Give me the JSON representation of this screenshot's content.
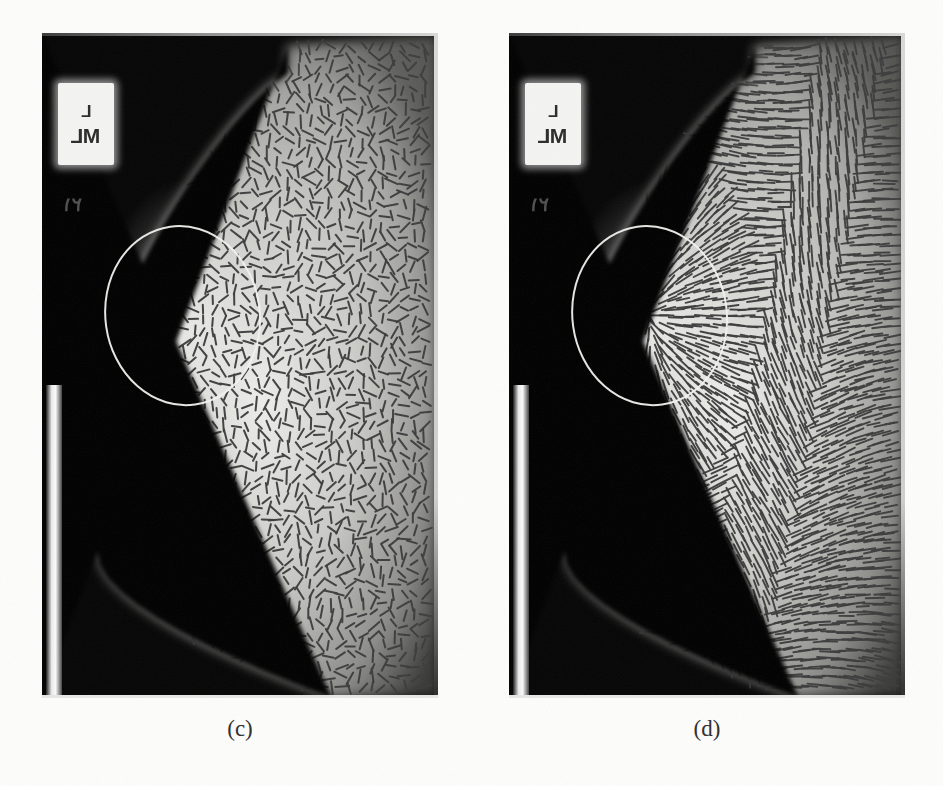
{
  "figure": {
    "background_color": "#fdfdfc",
    "panel_count": 2
  },
  "panels": [
    {
      "id": "panel-c",
      "caption": "(c)",
      "modality": "mammogram",
      "view_label_top": "L",
      "view_label_bottom": "ML",
      "film_digits": "٢١",
      "overlay_type": "orientation-field line segments",
      "overlay_description": "short incoherent dark line segments",
      "annotation_shape": "ellipse",
      "annotation_color": "#f2f2ee",
      "segment_length": 11,
      "segment_color": "#3c3c3c",
      "coherence": 0.18,
      "geometry": {
        "left": 42,
        "top": 33,
        "width": 396,
        "height": 665
      },
      "caption_position": {
        "left": 42,
        "top": 716,
        "width": 396
      }
    },
    {
      "id": "panel-d",
      "caption": "(d)",
      "modality": "mammogram",
      "view_label_top": "L",
      "view_label_bottom": "ML",
      "film_digits": "٢١",
      "overlay_type": "orientation-field line segments",
      "overlay_description": "long coherent flow-aligned streaks converging at the lesion",
      "annotation_shape": "ellipse",
      "annotation_color": "#f2f2ee",
      "segment_length": 17,
      "segment_color": "#3c3c3c",
      "coherence": 0.93,
      "geometry": {
        "left": 509,
        "top": 33,
        "width": 396,
        "height": 665
      },
      "caption_position": {
        "left": 509,
        "top": 716,
        "width": 396
      }
    }
  ],
  "marker": {
    "box_geometry": {
      "left": 16,
      "top": 50,
      "width": 56,
      "height": 82
    },
    "digits_geometry": {
      "left": 20,
      "top": 160
    }
  },
  "film_strip": {
    "geometry": {
      "left": 4,
      "top": 352,
      "width": 16,
      "height": 313
    }
  },
  "annotation_ellipse": {
    "cx_ratio": 0.355,
    "cy_ratio": 0.425,
    "rx_ratio": 0.195,
    "ry_ratio": 0.135,
    "rotation_deg": -8,
    "stroke_width": 2.0
  },
  "chart_data": {
    "type": "heatmap",
    "panels": [
      "(c)",
      "(d)"
    ],
    "legend": [],
    "grid": false
  }
}
